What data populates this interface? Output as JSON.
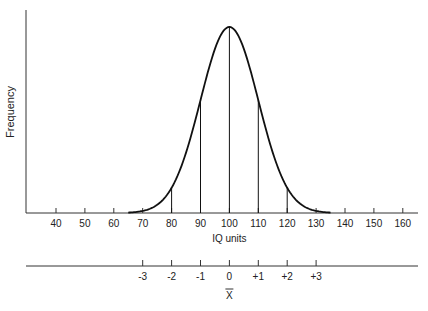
{
  "chart_data": {
    "type": "line",
    "title": "",
    "xlabel": "IQ units",
    "ylabel": "Frequency",
    "distribution": "normal",
    "mean": 100,
    "sd": 10,
    "x_ticks": [
      40,
      50,
      60,
      70,
      80,
      90,
      100,
      110,
      120,
      130,
      140,
      150,
      160
    ],
    "xlim": [
      30,
      165
    ],
    "curve_range": [
      65,
      135
    ],
    "vertical_lines_at": [
      80,
      90,
      100,
      110,
      120
    ],
    "grid": false,
    "legend": "none",
    "secondary_axis": {
      "ticks": [
        {
          "at": 70,
          "label": "-3"
        },
        {
          "at": 80,
          "label": "-2"
        },
        {
          "at": 90,
          "label": "-1"
        },
        {
          "at": 100,
          "label": "0"
        },
        {
          "at": 110,
          "label": "+1"
        },
        {
          "at": 120,
          "label": "+2"
        },
        {
          "at": 130,
          "label": "+3"
        }
      ],
      "label": "X̄"
    }
  },
  "colors": {
    "line": "#111111",
    "axis": "#333333",
    "text": "#222222"
  }
}
